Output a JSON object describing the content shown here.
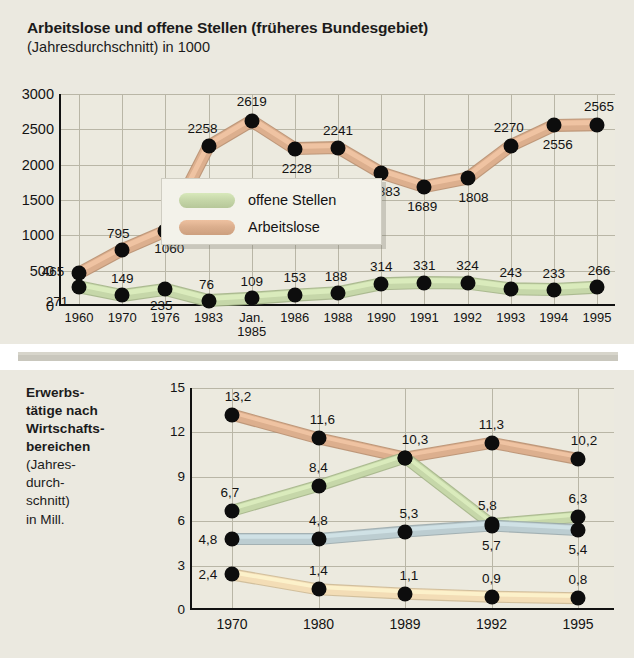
{
  "panel1": {
    "title": "Arbeitslose und offene Stellen (früheres Bundesgebiet)",
    "subtitle": "(Jahresdurchschnitt) in 1000",
    "legend": [
      {
        "label": "offene Stellen",
        "color": "#c6d7a9"
      },
      {
        "label": "Arbeitslose",
        "color": "#dcaf8e"
      }
    ]
  },
  "panel2": {
    "title_lines": [
      {
        "text": "Erwerbs-",
        "bold": true
      },
      {
        "text": "tätige nach",
        "bold": true
      },
      {
        "text": "Wirtschafts-",
        "bold": true
      },
      {
        "text": "bereichen",
        "bold": true
      },
      {
        "text": "(Jahres-",
        "bold": false
      },
      {
        "text": "durch-",
        "bold": false
      },
      {
        "text": "schnitt)",
        "bold": false
      },
      {
        "text": "in Mill.",
        "bold": false
      }
    ]
  },
  "chart_data": [
    {
      "type": "line",
      "title": "Arbeitslose und offene Stellen (früheres Bundesgebiet)",
      "subtitle": "(Jahresdurchschnitt) in 1000",
      "xlabel": "",
      "ylabel": "in 1000",
      "ylim": [
        0,
        3000
      ],
      "yticks": [
        0,
        500,
        1000,
        1500,
        2000,
        2500,
        3000
      ],
      "ytick_labels": [
        "0",
        "500",
        "1000",
        "1500",
        "2000",
        "2500",
        "3000"
      ],
      "categories": [
        "1960",
        "1970",
        "1976",
        "1983",
        "Jan. 1985",
        "1986",
        "1988",
        "1990",
        "1991",
        "1992",
        "1993",
        "1994",
        "1995"
      ],
      "grid": true,
      "legend_position": "inside-center-left",
      "series": [
        {
          "name": "Arbeitslose",
          "color": "#dcaf8e",
          "values": [
            465,
            795,
            1060,
            2258,
            2619,
            2228,
            2241,
            1883,
            1689,
            1808,
            2270,
            2556,
            2565
          ],
          "labels": [
            "465",
            "795",
            "1060",
            "2258",
            "2619",
            "2228",
            "2241",
            "1883",
            "1689",
            "1808",
            "2270",
            "2556",
            "2565"
          ]
        },
        {
          "name": "offene Stellen",
          "color": "#c6d7a9",
          "values": [
            271,
            149,
            235,
            76,
            109,
            153,
            188,
            314,
            331,
            324,
            243,
            233,
            266
          ],
          "labels": [
            "271",
            "149",
            "235",
            "76",
            "109",
            "153",
            "188",
            "314",
            "331",
            "324",
            "243",
            "233",
            "266"
          ]
        }
      ]
    },
    {
      "type": "line",
      "title": "Erwerbstätige nach Wirtschaftsbereichen",
      "subtitle": "(Jahresdurchschnitt) in Mill.",
      "xlabel": "",
      "ylabel": "in Mill.",
      "ylim": [
        0,
        15
      ],
      "yticks": [
        0,
        3,
        6,
        9,
        12,
        15
      ],
      "ytick_labels": [
        "0",
        "3",
        "6",
        "9",
        "12",
        "15"
      ],
      "categories": [
        "1970",
        "1980",
        "1989",
        "1992",
        "1995"
      ],
      "grid": true,
      "legend_position": "none",
      "series": [
        {
          "name": "series-tan",
          "color": "#dcaf8e",
          "values": [
            13.2,
            11.6,
            10.3,
            11.3,
            10.2
          ],
          "labels": [
            "13,2",
            "11,6",
            "10,3",
            "11,3",
            "10,2"
          ]
        },
        {
          "name": "series-green",
          "color": "#c6d7a9",
          "values": [
            6.7,
            8.4,
            10.3,
            5.8,
            6.3
          ],
          "labels": [
            "6,7",
            "8,4",
            "10,3",
            "5,8",
            "6,3"
          ]
        },
        {
          "name": "series-blue",
          "color": "#bccdd1",
          "values": [
            4.8,
            4.8,
            5.3,
            5.7,
            5.4
          ],
          "labels": [
            "4,8",
            "4,8",
            "5,3",
            "5,7",
            "5,4"
          ]
        },
        {
          "name": "series-cream",
          "color": "#f3ddb6",
          "values": [
            2.4,
            1.4,
            1.1,
            0.9,
            0.8
          ],
          "labels": [
            "2,4",
            "1,4",
            "1,1",
            "0,9",
            "0,8"
          ]
        }
      ]
    }
  ]
}
